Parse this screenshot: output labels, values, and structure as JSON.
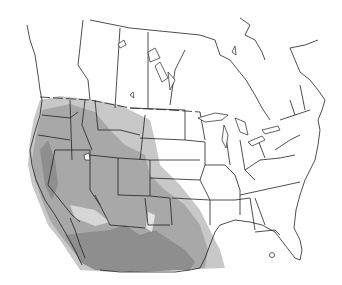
{
  "map": {
    "type": "range-distribution",
    "region": "North America (USA, southern Canada, northern Mexico)",
    "legend": [],
    "title": "",
    "colors": {
      "background": "#ffffff",
      "outline": "#222222",
      "range_light": "#c8c8c8",
      "range_mid": "#a8a8a8",
      "range_dark": "#8e8e8e"
    },
    "shaded_region": "Western North America: Pacific Northwest, Great Basin, Rocky Mountains, Southwest, and northern Mexico"
  }
}
